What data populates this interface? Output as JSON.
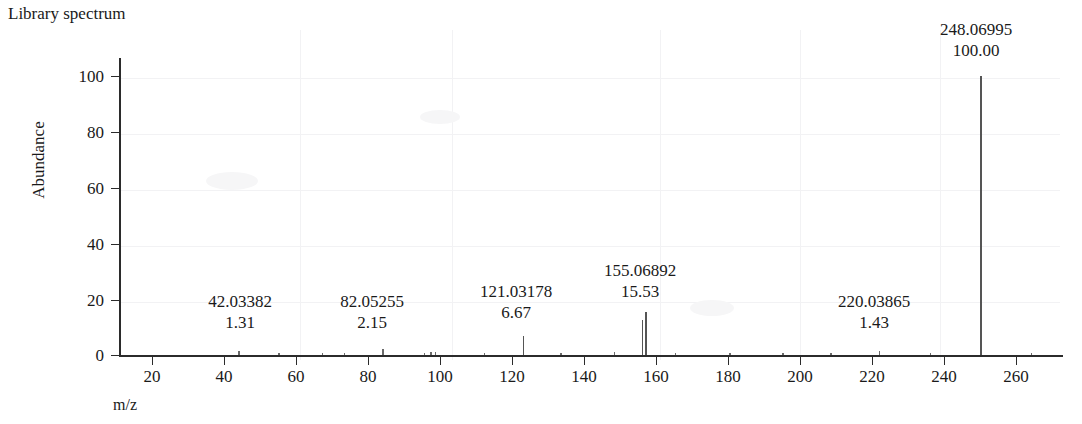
{
  "chart_data": {
    "type": "bar",
    "title": "Library spectrum",
    "xlabel": "m/z",
    "ylabel": "Abundance",
    "xlim": [
      10,
      272
    ],
    "ylim": [
      0,
      105
    ],
    "xticks": [
      20,
      40,
      60,
      80,
      100,
      120,
      140,
      160,
      180,
      200,
      220,
      240,
      260
    ],
    "yticks": [
      0,
      20,
      40,
      60,
      80,
      100
    ],
    "grid": false,
    "legend": null,
    "labeled_peaks": [
      {
        "mz": "42.03382",
        "abundance": "1.31"
      },
      {
        "mz": "82.05255",
        "abundance": "2.15"
      },
      {
        "mz": "121.03178",
        "abundance": "6.67"
      },
      {
        "mz": "155.06892",
        "abundance": "15.53"
      },
      {
        "mz": "220.03865",
        "abundance": "1.43"
      },
      {
        "mz": "248.06995",
        "abundance": "100.00"
      }
    ],
    "x": [
      42.03382,
      53.1,
      65.2,
      71.4,
      82.05255,
      93.5,
      95.4,
      96.6,
      110.2,
      121.03178,
      131.5,
      146.3,
      154.1,
      155.06892,
      163.2,
      178.4,
      193.1,
      206.5,
      220.03865,
      234.2,
      248.06995,
      262.1
    ],
    "values": [
      1.31,
      0.35,
      0.3,
      0.28,
      2.15,
      0.9,
      1.1,
      0.95,
      0.8,
      6.67,
      0.5,
      1.0,
      12.6,
      15.53,
      0.6,
      0.45,
      0.4,
      0.5,
      1.43,
      0.4,
      100.0,
      0.35
    ]
  },
  "axis": {
    "y_tick_labels": [
      "100",
      "80",
      "60",
      "40",
      "20",
      "0"
    ],
    "x_tick_labels": [
      "20",
      "40",
      "60",
      "80",
      "100",
      "120",
      "140",
      "160",
      "180",
      "200",
      "220",
      "240",
      "260"
    ],
    "y_title": "Abundance",
    "x_title": "m/z"
  },
  "header": {
    "title": "Library spectrum"
  },
  "annotations": [
    {
      "mz": "42.03382",
      "abundance": "1.31",
      "x": 240,
      "y": 291
    },
    {
      "mz": "82.05255",
      "abundance": "2.15",
      "x": 372,
      "y": 291
    },
    {
      "mz": "121.03178",
      "abundance": "6.67",
      "x": 516,
      "y": 281
    },
    {
      "mz": "155.06892",
      "abundance": "15.53",
      "x": 638,
      "y": 260
    },
    {
      "mz": "220.03865",
      "abundance": "1.43",
      "x": 874,
      "y": 291
    },
    {
      "mz": "248.06995",
      "abundance": "100.00",
      "x": 976,
      "y": 19
    }
  ]
}
